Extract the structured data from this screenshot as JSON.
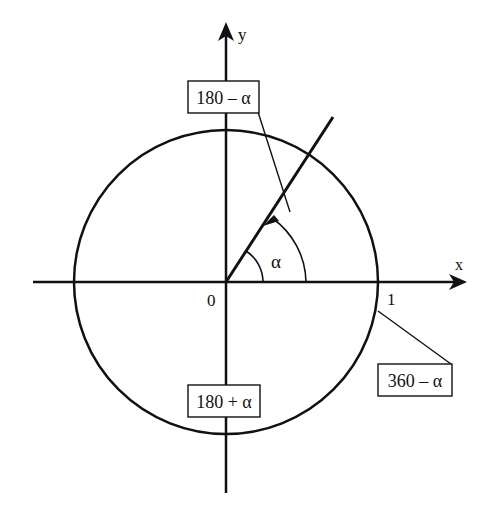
{
  "diagram": {
    "colors": {
      "stroke": "#111111",
      "background": "#ffffff"
    },
    "axes": {
      "x_label": "x",
      "y_label": "y",
      "origin_label": "0",
      "unit_label": "1"
    },
    "angle_label": "α",
    "boxes": [
      {
        "id": "q2",
        "label": "180 – α"
      },
      {
        "id": "q3",
        "label": "180 + α"
      },
      {
        "id": "q4",
        "label": "360 – α"
      }
    ]
  }
}
